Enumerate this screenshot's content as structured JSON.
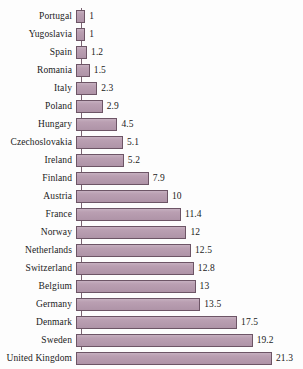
{
  "chart_data": {
    "type": "bar",
    "orientation": "horizontal",
    "title": "",
    "subtitle": "",
    "xlabel": "",
    "ylabel": "",
    "xlim": [
      0,
      21.3
    ],
    "grid": false,
    "legend": null,
    "axis_ticks_visible": false,
    "value_labels_visible": true,
    "bar_color": "#b69aae",
    "bar_border_color": "#6d5566",
    "background_color": "#fdfdfd",
    "text_color": "#1b1b1b",
    "categories": [
      "Portugal",
      "Yugoslavia",
      "Spain",
      "Romania",
      "Italy",
      "Poland",
      "Hungary",
      "Czechoslovakia",
      "Ireland",
      "Finland",
      "Austria",
      "France",
      "Norway",
      "Netherlands",
      "Switzerland",
      "Belgium",
      "Germany",
      "Denmark",
      "Sweden",
      "United Kingdom"
    ],
    "values": [
      1,
      1,
      1.2,
      1.5,
      2.3,
      2.9,
      4.5,
      5.1,
      5.2,
      7.9,
      10,
      11.4,
      12,
      12.5,
      12.8,
      13,
      13.5,
      17.5,
      19.2,
      21.3
    ],
    "value_labels": [
      "1",
      "1",
      "1.2",
      "1.5",
      "2.3",
      "2.9",
      "4.5",
      "5.1",
      "5.2",
      "7.9",
      "10",
      "11.4",
      "12",
      "12.5",
      "12.8",
      "13",
      "13.5",
      "17.5",
      "19.2",
      "21.3"
    ]
  }
}
